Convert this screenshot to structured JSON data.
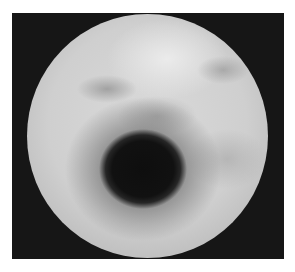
{
  "image": {
    "description": "Grayscale circular endoscopic view with a dark central-lower lumen on a black square frame",
    "colors": {
      "page_background": "#ffffff",
      "frame": "#161616",
      "mucosa": "#d0d0d0",
      "lumen": "#0e0e0e"
    }
  }
}
